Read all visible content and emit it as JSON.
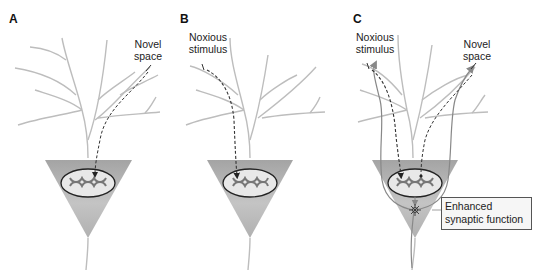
{
  "panels": [
    {
      "label": "A",
      "annotations": [
        "Novel space"
      ]
    },
    {
      "label": "B",
      "annotations": [
        "Noxious stimulus"
      ]
    },
    {
      "label": "C",
      "annotations": [
        "Noxious stimulus",
        "Novel space"
      ],
      "callout": "Enhanced synaptic function"
    }
  ],
  "text": {
    "a_label": "A",
    "b_label": "B",
    "c_label": "C",
    "a_novel_1": "Novel",
    "a_novel_2": "space",
    "b_noxious_1": "Noxious",
    "b_noxious_2": "stimulus",
    "c_noxious_1": "Noxious",
    "c_noxious_2": "stimulus",
    "c_novel_1": "Novel",
    "c_novel_2": "space",
    "c_callout": "Enhanced synaptic function"
  },
  "colors": {
    "soma": "#a8a8a8",
    "dendrite": "#b9b9b9",
    "nucleus_fill": "#e6e6e6",
    "arrow": "#333333",
    "pathway": "#777777"
  }
}
